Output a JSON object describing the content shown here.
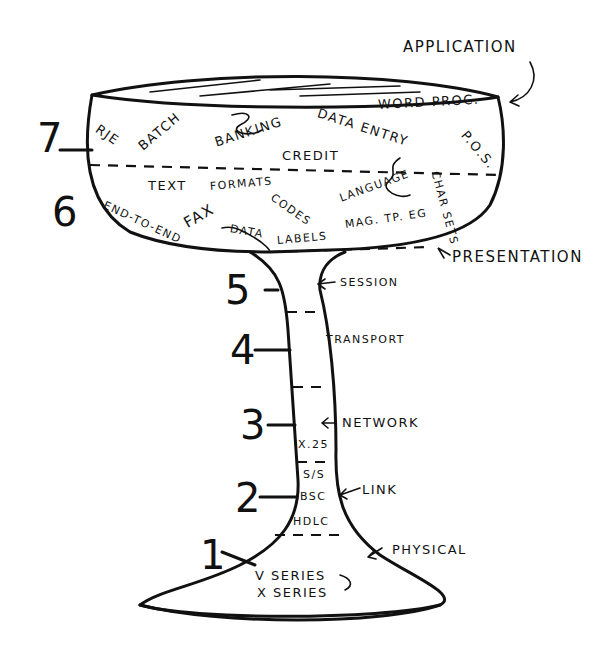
{
  "layers": [
    {
      "number": "7",
      "name": "APPLICATION",
      "examples": [
        "RJE",
        "BATCH",
        "BANKING",
        "DATA ENTRY",
        "WORD PROC.",
        "P.O.S.",
        "CREDIT"
      ]
    },
    {
      "number": "6",
      "name": "PRESENTATION",
      "examples": [
        "TEXT",
        "FORMATS",
        "CODES",
        "LANGUAGE",
        "CHAR SETS",
        "END-TO-END",
        "FAX",
        "DATA",
        "LABELS",
        "MAG. TP. EG"
      ]
    },
    {
      "number": "5",
      "name": "SESSION",
      "examples": []
    },
    {
      "number": "4",
      "name": "TRANSPORT",
      "examples": []
    },
    {
      "number": "3",
      "name": "NETWORK",
      "examples": [
        "X.25"
      ]
    },
    {
      "number": "2",
      "name": "LINK",
      "examples": [
        "S/S",
        "BSC",
        "HDLC"
      ]
    },
    {
      "number": "1",
      "name": "PHYSICAL",
      "examples": [
        "V SERIES",
        "X SERIES"
      ]
    }
  ],
  "labels": {
    "application": "APPLICATION",
    "presentation": "PRESENTATION",
    "session": "SESSION",
    "transport": "TRANSPORT",
    "network": "NETWORK",
    "link": "LINK",
    "physical": "PHYSICAL",
    "rje": "RJE",
    "batch": "BATCH",
    "banking": "BANKING",
    "data_entry": "DATA ENTRY",
    "word_proc": "WORD PROC.",
    "pos": "P.O.S.",
    "credit": "CREDIT",
    "text": "TEXT",
    "formats": "FORMATS",
    "codes": "CODES",
    "language": "LANGUAGE",
    "char_sets": "CHAR SETS",
    "end_to_end": "END-TO-END",
    "fax": "FAX",
    "data": "DATA",
    "labels": "LABELS",
    "mag_tpeg": "MAG. TP. EG",
    "x25": "X.25",
    "ss": "S/S",
    "bsc": "BSC",
    "hdlc": "HDLC",
    "v_series": "V SERIES",
    "x_series": "X SERIES"
  },
  "numbers": {
    "n7": "7",
    "n6": "6",
    "n5": "5",
    "n4": "4",
    "n3": "3",
    "n2": "2",
    "n1": "1"
  }
}
